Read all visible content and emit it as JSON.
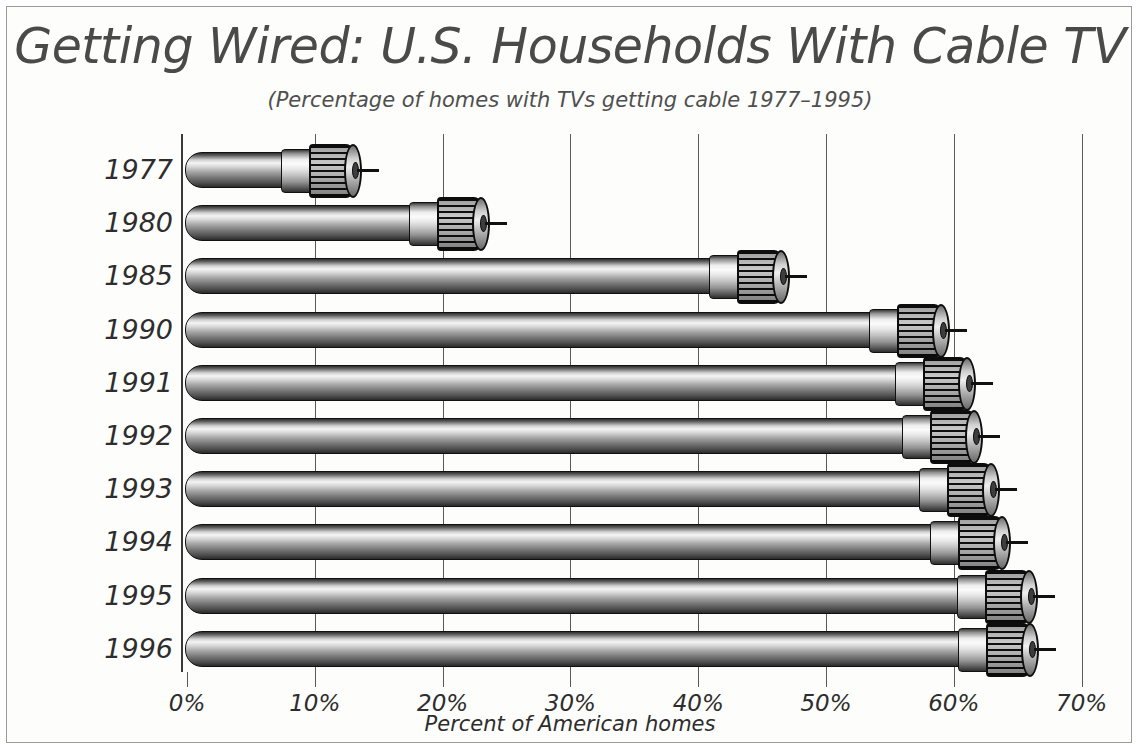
{
  "chart_data": {
    "type": "bar",
    "orientation": "horizontal",
    "title": "Getting Wired: U.S. Households With Cable TV",
    "subtitle": "(Percentage of homes with TVs getting cable 1977–1995)",
    "xlabel": "Percent of American homes",
    "ylabel": "",
    "xlim": [
      0,
      70
    ],
    "xticks": [
      0,
      10,
      20,
      30,
      40,
      50,
      60,
      70
    ],
    "xtick_labels": [
      "0%",
      "10%",
      "20%",
      "30%",
      "40%",
      "50%",
      "60%",
      "70%"
    ],
    "grid": true,
    "legend": false,
    "categories": [
      "1977",
      "1980",
      "1985",
      "1990",
      "1991",
      "1992",
      "1993",
      "1994",
      "1995",
      "1996"
    ],
    "values": [
      13,
      23,
      46.5,
      59,
      61,
      61.6,
      62.9,
      63.8,
      65.9,
      66
    ],
    "bar_style": "coaxial-cable-with-f-connector",
    "colors": {
      "background": "#fdfdfb",
      "border": "#9a9a9a",
      "title_text": "#4a4a4a",
      "label_text": "#2d2d2d",
      "gridline": "#5a5a5a",
      "bar_highlight": "#f4f4f4",
      "bar_shadow": "#2a2a2a"
    }
  },
  "axis": {
    "title": "Percent of American homes"
  }
}
